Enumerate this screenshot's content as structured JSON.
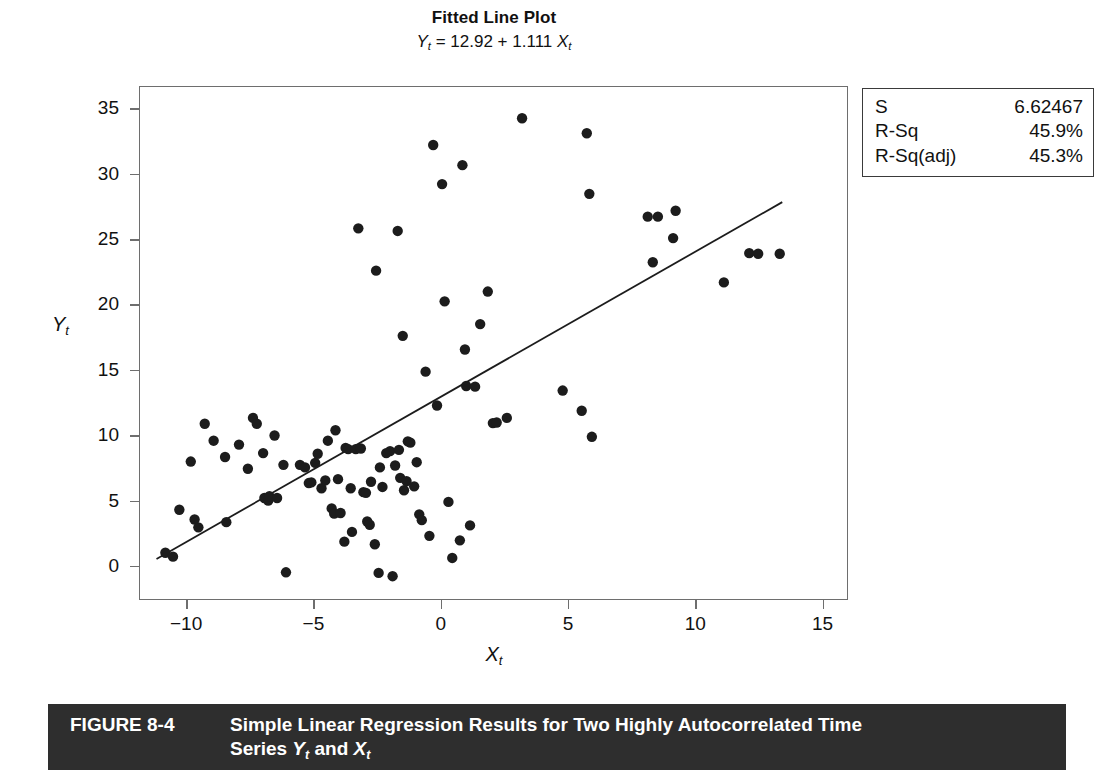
{
  "figure": {
    "caption_number": "FIGURE 8-4",
    "caption_line1": "Simple Linear Regression Results for Two Highly Autocorrelated Time",
    "caption_line2_prefix": "Series ",
    "caption_var_y": "Y",
    "caption_sub_t1": "t",
    "caption_and": " and ",
    "caption_var_x": "X",
    "caption_sub_t2": "t",
    "bar_color": "#2e2e2e",
    "bar_text_color": "#ffffff"
  },
  "stats_box": {
    "rows": [
      {
        "label": "S",
        "value": "6.62467"
      },
      {
        "label": "R-Sq",
        "value": "45.9%"
      },
      {
        "label": "R-Sq(adj)",
        "value": "45.3%"
      }
    ]
  },
  "chart_data": {
    "type": "scatter",
    "title": "Fitted Line Plot",
    "subtitle_prefix": "Y",
    "subtitle_sub1": "t",
    "subtitle_equation": " = 12.92 + 1.111 ",
    "subtitle_varx": "X",
    "subtitle_sub2": "t",
    "equation_text": "Yt = 12.92 + 1.111 Xt",
    "intercept": 12.92,
    "slope": 1.111,
    "xlabel": "Xt",
    "ylabel": "Yt",
    "xlim": [
      -11.85,
      16.0
    ],
    "ylim": [
      -2.6,
      36.7
    ],
    "xticks": [
      -10,
      -5,
      0,
      5,
      10,
      15
    ],
    "xtick_labels": [
      "−10",
      "−5",
      "0",
      "5",
      "10",
      "15"
    ],
    "yticks": [
      0,
      5,
      10,
      15,
      20,
      25,
      30,
      35
    ],
    "ytick_labels": [
      "0",
      "5",
      "10",
      "15",
      "20",
      "25",
      "30",
      "35"
    ],
    "grid": false,
    "legend": "none",
    "marker_color": "#1c1c1c",
    "marker_size": 5.2,
    "line_color": "#1c1c1c",
    "line_width": 1.8,
    "fit_line_x_range": [
      -11.2,
      13.45
    ],
    "points": [
      [
        -10.85,
        0.95
      ],
      [
        -10.55,
        0.65
      ],
      [
        -10.3,
        4.25
      ],
      [
        -9.85,
        7.95
      ],
      [
        -9.7,
        3.5
      ],
      [
        -9.55,
        2.9
      ],
      [
        -9.3,
        10.85
      ],
      [
        -8.95,
        9.55
      ],
      [
        -8.5,
        8.3
      ],
      [
        -8.45,
        3.3
      ],
      [
        -7.95,
        9.25
      ],
      [
        -7.6,
        7.4
      ],
      [
        -7.4,
        11.3
      ],
      [
        -7.25,
        10.85
      ],
      [
        -7.0,
        8.6
      ],
      [
        -6.95,
        5.15
      ],
      [
        -6.8,
        4.95
      ],
      [
        -6.75,
        5.3
      ],
      [
        -6.55,
        9.95
      ],
      [
        -6.45,
        5.15
      ],
      [
        -6.2,
        7.7
      ],
      [
        -6.1,
        -0.55
      ],
      [
        -5.55,
        7.7
      ],
      [
        -5.35,
        7.5
      ],
      [
        -5.2,
        6.3
      ],
      [
        -5.1,
        6.35
      ],
      [
        -4.95,
        7.85
      ],
      [
        -4.85,
        8.55
      ],
      [
        -4.7,
        5.9
      ],
      [
        -4.55,
        6.5
      ],
      [
        -4.45,
        9.55
      ],
      [
        -4.3,
        4.35
      ],
      [
        -4.2,
        3.95
      ],
      [
        -4.15,
        10.35
      ],
      [
        -4.05,
        6.6
      ],
      [
        -3.95,
        4.0
      ],
      [
        -3.8,
        1.8
      ],
      [
        -3.75,
        9.0
      ],
      [
        -3.65,
        8.9
      ],
      [
        -3.55,
        5.9
      ],
      [
        -3.5,
        2.55
      ],
      [
        -3.35,
        8.9
      ],
      [
        -3.25,
        25.85
      ],
      [
        -3.15,
        8.95
      ],
      [
        -3.05,
        5.6
      ],
      [
        -2.95,
        5.55
      ],
      [
        -2.9,
        3.35
      ],
      [
        -2.8,
        3.1
      ],
      [
        -2.75,
        6.4
      ],
      [
        -2.6,
        1.6
      ],
      [
        -2.55,
        22.6
      ],
      [
        -2.45,
        -0.6
      ],
      [
        -2.4,
        7.5
      ],
      [
        -2.3,
        6.0
      ],
      [
        -2.15,
        8.6
      ],
      [
        -2.0,
        8.75
      ],
      [
        -1.9,
        -0.85
      ],
      [
        -1.8,
        7.65
      ],
      [
        -1.7,
        25.65
      ],
      [
        -1.65,
        8.85
      ],
      [
        -1.6,
        6.7
      ],
      [
        -1.5,
        17.6
      ],
      [
        -1.45,
        5.75
      ],
      [
        -1.35,
        6.45
      ],
      [
        -1.3,
        9.5
      ],
      [
        -1.2,
        9.4
      ],
      [
        -1.05,
        6.05
      ],
      [
        -0.95,
        7.9
      ],
      [
        -0.85,
        3.9
      ],
      [
        -0.75,
        3.45
      ],
      [
        -0.6,
        14.85
      ],
      [
        -0.45,
        2.25
      ],
      [
        -0.3,
        32.25
      ],
      [
        -0.15,
        12.25
      ],
      [
        0.05,
        29.25
      ],
      [
        0.15,
        20.25
      ],
      [
        0.3,
        4.85
      ],
      [
        0.45,
        0.55
      ],
      [
        0.75,
        1.9
      ],
      [
        0.85,
        30.7
      ],
      [
        0.95,
        16.55
      ],
      [
        1.0,
        13.75
      ],
      [
        1.15,
        3.05
      ],
      [
        1.35,
        13.7
      ],
      [
        1.55,
        18.5
      ],
      [
        1.85,
        21.0
      ],
      [
        2.05,
        10.9
      ],
      [
        2.2,
        10.95
      ],
      [
        2.6,
        11.3
      ],
      [
        3.2,
        34.3
      ],
      [
        4.8,
        13.4
      ],
      [
        5.55,
        11.85
      ],
      [
        5.75,
        33.15
      ],
      [
        5.85,
        28.5
      ],
      [
        5.95,
        9.85
      ],
      [
        8.15,
        26.75
      ],
      [
        8.35,
        23.25
      ],
      [
        8.55,
        26.75
      ],
      [
        9.15,
        25.1
      ],
      [
        9.25,
        27.2
      ],
      [
        11.15,
        21.7
      ],
      [
        12.15,
        23.95
      ],
      [
        12.5,
        23.9
      ],
      [
        13.35,
        23.9
      ]
    ]
  }
}
